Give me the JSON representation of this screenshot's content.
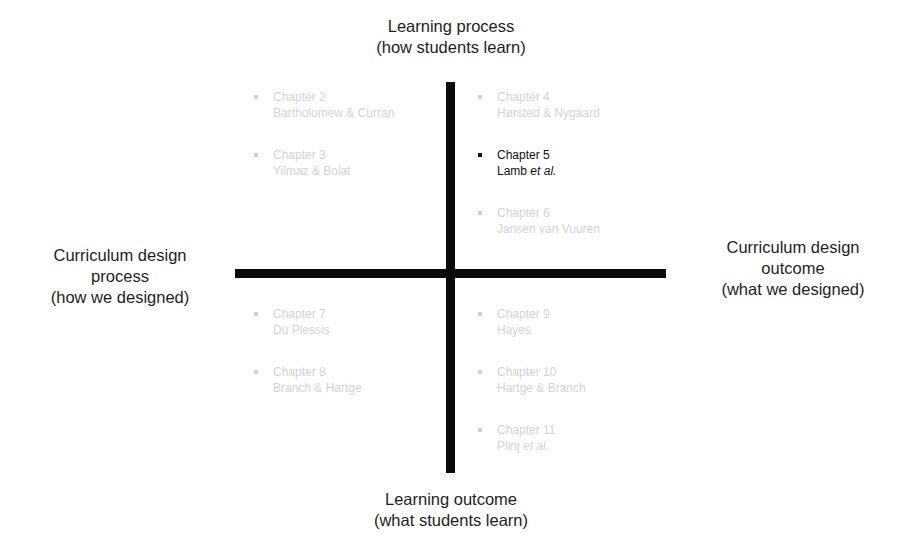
{
  "axes": {
    "top": {
      "line1": "Learning process",
      "line2": "(how students learn)"
    },
    "bottom": {
      "line1": "Learning outcome",
      "line2": "(what students learn)"
    },
    "left": {
      "line1": "Curriculum design",
      "line2": "process",
      "line3": "(how we designed)"
    },
    "right": {
      "line1": "Curriculum design",
      "line2": "outcome",
      "line3": "(what we designed)"
    }
  },
  "colors": {
    "axis": "#0a0a0a",
    "active_text": "#111111",
    "faded_text": "#d4d4d4"
  },
  "quadrants": {
    "top_left": [
      {
        "chapter": "Chapter 2",
        "authors": "Bartholomew & Curran",
        "italic": "",
        "active": false
      },
      {
        "chapter": "Chapter 3",
        "authors": "Yilmaz & Bolat",
        "italic": "",
        "active": false
      }
    ],
    "top_right": [
      {
        "chapter": "Chapter 4",
        "authors": "Hørsted & Nygaard",
        "italic": "",
        "active": false
      },
      {
        "chapter": "Chapter 5",
        "authors": "Lamb ",
        "italic": "et al.",
        "active": true
      },
      {
        "chapter": "Chapter 6",
        "authors": "Jansen van Vuuren",
        "italic": "",
        "active": false
      }
    ],
    "bottom_left": [
      {
        "chapter": "Chapter 7",
        "authors": "Du Plessis",
        "italic": "",
        "active": false
      },
      {
        "chapter": "Chapter 8",
        "authors": "Branch & Hartge",
        "italic": "",
        "active": false
      }
    ],
    "bottom_right": [
      {
        "chapter": "Chapter 9",
        "authors": "Hayes",
        "italic": "",
        "active": false
      },
      {
        "chapter": "Chapter 10",
        "authors": "Hartge & Branch",
        "italic": "",
        "active": false
      },
      {
        "chapter": "Chapter 11",
        "authors": "Pilnj ",
        "italic": "et al.",
        "active": false
      }
    ]
  }
}
